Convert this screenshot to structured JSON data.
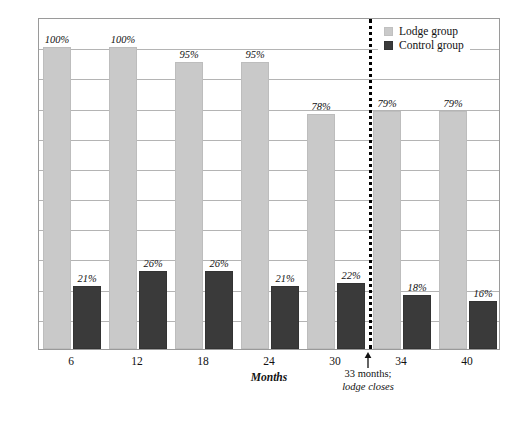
{
  "chart_data": {
    "type": "bar",
    "title": "",
    "xlabel": "Months",
    "ylabel": "Median Percentage of Time in Community",
    "categories": [
      "6",
      "12",
      "18",
      "24",
      "30",
      "34",
      "40"
    ],
    "ylim": [
      0,
      110
    ],
    "grid": true,
    "gridline_values": [
      10,
      20,
      30,
      40,
      50,
      60,
      70,
      80,
      90,
      100
    ],
    "legend_position": "top-right",
    "series": [
      {
        "name": "Lodge group",
        "color": "#c9c9c9",
        "values": [
          100,
          100,
          95,
          95,
          78,
          79,
          79
        ],
        "labels": [
          "100%",
          "100%",
          "95%",
          "95%",
          "78%",
          "79%",
          "79%"
        ]
      },
      {
        "name": "Control group",
        "color": "#3a3a3a",
        "values": [
          21,
          26,
          26,
          21,
          22,
          18,
          16
        ],
        "labels": [
          "21%",
          "26%",
          "26%",
          "21%",
          "22%",
          "18%",
          "16%"
        ]
      }
    ],
    "annotations": [
      {
        "name": "lodge-closure-marker",
        "line1": "33 months;",
        "line2": "lodge closes",
        "x_months": 33,
        "style": "vertical dotted line with upward arrow"
      }
    ]
  },
  "legend": {
    "items": [
      {
        "label": "Lodge group",
        "color": "#c9c9c9"
      },
      {
        "label": "Control group",
        "color": "#3a3a3a"
      }
    ]
  },
  "axes": {
    "y_title": "Median Percentage of Time in Community",
    "x_title": "Months",
    "x_ticks": [
      "6",
      "12",
      "18",
      "24",
      "30",
      "34",
      "40"
    ]
  },
  "annotation": {
    "line1": "33 months;",
    "line2": "lodge closes"
  },
  "caption": ""
}
